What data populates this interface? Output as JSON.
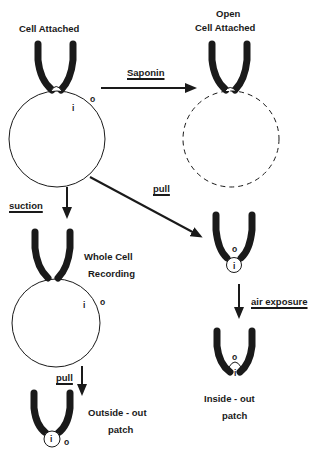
{
  "diagram": {
    "type": "patch-clamp configurations",
    "nodes": [
      {
        "id": "cell_attached",
        "label": "Cell Attached"
      },
      {
        "id": "open_cell_attached",
        "label_line1": "Open",
        "label_line2": "Cell Attached"
      },
      {
        "id": "whole_cell",
        "label_line1": "Whole Cell",
        "label_line2": "Recording"
      },
      {
        "id": "inside_out_intermediate",
        "label": ""
      },
      {
        "id": "inside_out",
        "label_line1": "Inside - out",
        "label_line2": "patch"
      },
      {
        "id": "outside_out",
        "label_line1": "Outside - out",
        "label_line2": "patch"
      }
    ],
    "edges": [
      {
        "from": "cell_attached",
        "to": "open_cell_attached",
        "label": "Saponin"
      },
      {
        "from": "cell_attached",
        "to": "whole_cell",
        "label": "suction"
      },
      {
        "from": "cell_attached",
        "to": "inside_out_intermediate",
        "label": "pull"
      },
      {
        "from": "inside_out_intermediate",
        "to": "inside_out",
        "label": "air exposure"
      },
      {
        "from": "whole_cell",
        "to": "outside_out",
        "label": "pull"
      }
    ],
    "side_markers": {
      "inside": "i",
      "outside": "o"
    },
    "colors": {
      "ink": "#1a1a1a",
      "background": "#ffffff"
    }
  }
}
